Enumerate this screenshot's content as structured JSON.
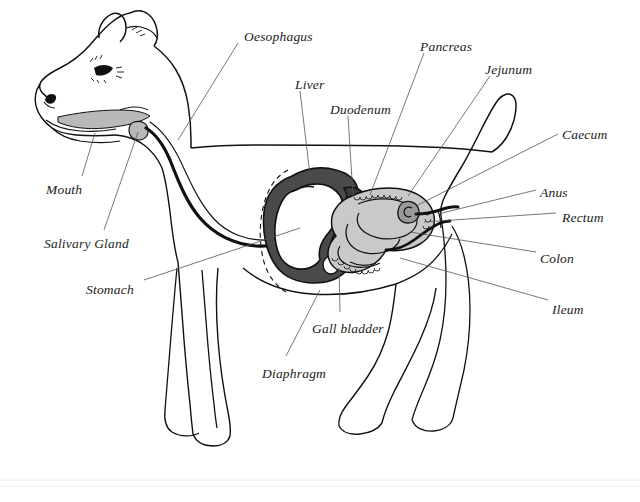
{
  "figure": {
    "topic": "digestive system",
    "style": "ink line drawing with grey wash",
    "background_color": "#ffffff",
    "ink_color": "#111111",
    "leader_line_color": "#555555"
  },
  "palette": {
    "paper": "#ffffff",
    "outline": "#111111",
    "liver_fill": "#4a4a4a",
    "intestine_fill": "#c9c9c9",
    "mouth_fill": "#b9b9b9",
    "stomach_fill": "#ffffff",
    "gall_bladder_fill": "#ffffff",
    "pancreas_fill": "#3c3c3c"
  },
  "labels": [
    {
      "id": "oesophagus",
      "text": "Oesophagus",
      "x": 244,
      "y": 30,
      "anchor": "start",
      "leader": [
        [
          238,
          43
        ],
        [
          178,
          140
        ]
      ]
    },
    {
      "id": "liver",
      "text": "Liver",
      "x": 295,
      "y": 78,
      "anchor": "start",
      "leader": [
        [
          300,
          91
        ],
        [
          310,
          175
        ]
      ]
    },
    {
      "id": "duodenum",
      "text": "Duodenum",
      "x": 330,
      "y": 103,
      "anchor": "start",
      "leader": [
        [
          348,
          116
        ],
        [
          353,
          196
        ]
      ]
    },
    {
      "id": "pancreas",
      "text": "Pancreas",
      "x": 420,
      "y": 40,
      "anchor": "start",
      "leader": [
        [
          424,
          53
        ],
        [
          370,
          195
        ]
      ]
    },
    {
      "id": "jejunum",
      "text": "Jejunum",
      "x": 485,
      "y": 63,
      "anchor": "start",
      "leader": [
        [
          490,
          76
        ],
        [
          408,
          196
        ]
      ]
    },
    {
      "id": "caecum",
      "text": "Caecum",
      "x": 562,
      "y": 128,
      "anchor": "start",
      "leader": [
        [
          558,
          134
        ],
        [
          418,
          205
        ]
      ]
    },
    {
      "id": "anus",
      "text": "Anus",
      "x": 540,
      "y": 186,
      "anchor": "start",
      "leader": [
        [
          536,
          190
        ],
        [
          442,
          213
        ]
      ]
    },
    {
      "id": "rectum",
      "text": "Rectum",
      "x": 562,
      "y": 211,
      "anchor": "start",
      "leader": [
        [
          556,
          213
        ],
        [
          424,
          222
        ]
      ]
    },
    {
      "id": "colon",
      "text": "Colon",
      "x": 540,
      "y": 252,
      "anchor": "start",
      "leader": [
        [
          536,
          252
        ],
        [
          410,
          232
        ]
      ]
    },
    {
      "id": "ileum",
      "text": "Ileum",
      "x": 552,
      "y": 303,
      "anchor": "start",
      "leader": [
        [
          548,
          300
        ],
        [
          400,
          258
        ]
      ]
    },
    {
      "id": "mouth",
      "text": "Mouth",
      "x": 46,
      "y": 183,
      "anchor": "start",
      "leader": [
        [
          82,
          176
        ],
        [
          95,
          133
        ]
      ]
    },
    {
      "id": "salivary-gland",
      "text": "Salivary Gland",
      "x": 44,
      "y": 237,
      "anchor": "start",
      "leader": [
        [
          104,
          230
        ],
        [
          138,
          132
        ]
      ]
    },
    {
      "id": "stomach",
      "text": "Stomach",
      "x": 86,
      "y": 283,
      "anchor": "start",
      "leader": [
        [
          144,
          280
        ],
        [
          300,
          228
        ]
      ]
    },
    {
      "id": "gall-bladder",
      "text": "Gall bladder",
      "x": 312,
      "y": 322,
      "anchor": "start",
      "leader": [
        [
          340,
          312
        ],
        [
          339,
          268
        ]
      ]
    },
    {
      "id": "diaphragm",
      "text": "Diaphragm",
      "x": 262,
      "y": 367,
      "anchor": "start",
      "leader": [
        [
          286,
          356
        ],
        [
          320,
          290
        ]
      ]
    }
  ]
}
